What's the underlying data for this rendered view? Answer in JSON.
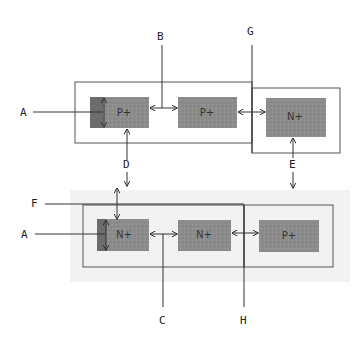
{
  "diagram": {
    "colors": {
      "region_fill": "#8a8a8a",
      "region_dark": "#6a6a6a",
      "band_fill": "#f2f2f2",
      "line": "#333333"
    },
    "top": {
      "regions": [
        {
          "id": "top-p1",
          "label": "P+"
        },
        {
          "id": "top-p2",
          "label": "P+"
        },
        {
          "id": "top-n1",
          "label": "N+"
        }
      ],
      "labels": {
        "A": "A",
        "B": "B",
        "G": "G",
        "D": "D",
        "E": "E"
      }
    },
    "bottom": {
      "regions": [
        {
          "id": "bot-n1",
          "label": "N+"
        },
        {
          "id": "bot-n2",
          "label": "N+"
        },
        {
          "id": "bot-p1",
          "label": "P+"
        }
      ],
      "labels": {
        "F": "F",
        "A": "A",
        "C": "C",
        "H": "H"
      }
    }
  }
}
